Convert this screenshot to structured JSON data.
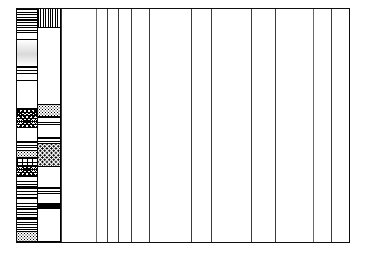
{
  "figure": {
    "type": "stratigraphic-column",
    "background_color": "#ffffff",
    "line_color": "#0d0d0d",
    "width_px": 368,
    "height_px": 253
  },
  "frame": {
    "left_px": 16,
    "top_px": 8,
    "width_px": 334,
    "height_px": 235,
    "border_px": 1.4
  },
  "chart_data": {
    "type": "table",
    "xlabel": "",
    "ylabel": "",
    "grid": true,
    "legend_position": "none",
    "columns": [
      {
        "name": "lithology-a",
        "x_px": 16,
        "width_px": 21,
        "filled": true
      },
      {
        "name": "lithology-b",
        "x_px": 37,
        "width_px": 23,
        "filled": true
      },
      {
        "name": "column-1",
        "x_px": 60,
        "width_px": 35,
        "filled": false
      },
      {
        "name": "column-2",
        "x_px": 95,
        "width_px": 11,
        "filled": false
      },
      {
        "name": "column-3",
        "x_px": 106,
        "width_px": 11,
        "filled": false
      },
      {
        "name": "column-4",
        "x_px": 117,
        "width_px": 13,
        "filled": false
      },
      {
        "name": "column-5",
        "x_px": 130,
        "width_px": 18,
        "filled": false
      },
      {
        "name": "column-6",
        "x_px": 148,
        "width_px": 42,
        "filled": false
      },
      {
        "name": "column-7",
        "x_px": 190,
        "width_px": 20,
        "filled": false
      },
      {
        "name": "column-8",
        "x_px": 210,
        "width_px": 40,
        "filled": false
      },
      {
        "name": "column-9",
        "x_px": 250,
        "width_px": 24,
        "filled": false
      },
      {
        "name": "column-10",
        "x_px": 274,
        "width_px": 38,
        "filled": false
      },
      {
        "name": "column-11",
        "x_px": 312,
        "width_px": 18,
        "filled": false
      },
      {
        "name": "column-12",
        "x_px": 330,
        "width_px": 20,
        "filled": false
      }
    ],
    "vertical_rule_positions_px": [
      60,
      95,
      106,
      117,
      130,
      148,
      190,
      210,
      250,
      274,
      312,
      330
    ],
    "series": [
      {
        "name": "lithology-a",
        "beds": [
          {
            "top_pct": 0.0,
            "height_pct": 10.5,
            "pattern": "p-shale-dk",
            "label": "laminated shale"
          },
          {
            "top_pct": 10.5,
            "height_pct": 3.0,
            "pattern": "p-blank",
            "label": "blank"
          },
          {
            "top_pct": 13.5,
            "height_pct": 11.5,
            "pattern": "p-grade",
            "label": "graded sandstone"
          },
          {
            "top_pct": 25.0,
            "height_pct": 6.0,
            "pattern": "p-silt",
            "label": "siltstone"
          },
          {
            "top_pct": 31.0,
            "height_pct": 12.0,
            "pattern": "p-blank",
            "label": "blank"
          },
          {
            "top_pct": 43.0,
            "height_pct": 8.0,
            "pattern": "p-mottle",
            "label": "mottled mudstone"
          },
          {
            "top_pct": 51.0,
            "height_pct": 6.0,
            "pattern": "p-blank",
            "label": "blank"
          },
          {
            "top_pct": 57.0,
            "height_pct": 4.0,
            "pattern": "p-shale",
            "label": "shale"
          },
          {
            "top_pct": 61.0,
            "height_pct": 3.0,
            "pattern": "p-sand",
            "label": "sandstone"
          },
          {
            "top_pct": 64.0,
            "height_pct": 3.5,
            "pattern": "p-brick",
            "label": "limestone"
          },
          {
            "top_pct": 67.5,
            "height_pct": 4.0,
            "pattern": "p-mottle",
            "label": "mottled mudstone"
          },
          {
            "top_pct": 71.5,
            "height_pct": 5.5,
            "pattern": "p-shale",
            "label": "shale"
          },
          {
            "top_pct": 77.0,
            "height_pct": 4.0,
            "pattern": "p-silt",
            "label": "siltstone"
          },
          {
            "top_pct": 81.0,
            "height_pct": 5.0,
            "pattern": "p-shale",
            "label": "shale"
          },
          {
            "top_pct": 86.0,
            "height_pct": 4.0,
            "pattern": "p-shale-dk",
            "label": "dark shale"
          },
          {
            "top_pct": 90.0,
            "height_pct": 5.5,
            "pattern": "p-shale",
            "label": "shale"
          },
          {
            "top_pct": 95.5,
            "height_pct": 4.5,
            "pattern": "p-sand",
            "label": "sandstone"
          }
        ]
      },
      {
        "name": "lithology-b",
        "beds": [
          {
            "top_pct": 0.0,
            "height_pct": 8.0,
            "pattern": "p-vrule",
            "label": "vertically ruled unit"
          },
          {
            "top_pct": 8.0,
            "height_pct": 33.0,
            "pattern": "p-blank",
            "label": "blank"
          },
          {
            "top_pct": 41.0,
            "height_pct": 5.5,
            "pattern": "p-sand",
            "label": "sandstone"
          },
          {
            "top_pct": 46.5,
            "height_pct": 3.5,
            "pattern": "p-shale",
            "label": "shale"
          },
          {
            "top_pct": 50.0,
            "height_pct": 5.5,
            "pattern": "p-blank",
            "label": "blank"
          },
          {
            "top_pct": 55.5,
            "height_pct": 2.5,
            "pattern": "p-shale-dk",
            "label": "dark shale"
          },
          {
            "top_pct": 58.0,
            "height_pct": 10.0,
            "pattern": "p-congl",
            "label": "conglomerate"
          },
          {
            "top_pct": 68.0,
            "height_pct": 9.0,
            "pattern": "p-blank",
            "label": "blank"
          },
          {
            "top_pct": 77.0,
            "height_pct": 2.5,
            "pattern": "p-shale-dk",
            "label": "dark shale"
          },
          {
            "top_pct": 79.5,
            "height_pct": 4.0,
            "pattern": "p-blank",
            "label": "blank"
          },
          {
            "top_pct": 83.5,
            "height_pct": 2.5,
            "pattern": "p-coal",
            "label": "coal"
          },
          {
            "top_pct": 86.0,
            "height_pct": 14.0,
            "pattern": "p-blank",
            "label": "blank"
          }
        ]
      }
    ]
  }
}
